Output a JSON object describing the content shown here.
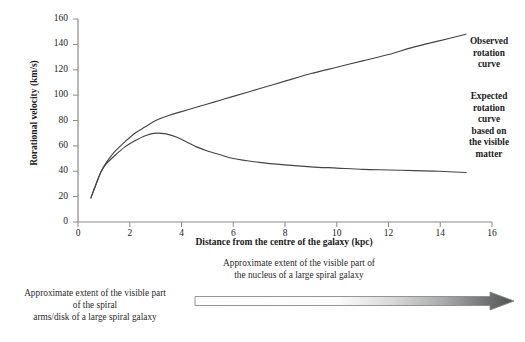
{
  "chart_data": {
    "type": "line",
    "title": "",
    "xlabel": "Distance from the centre of the galaxy (kpc)",
    "ylabel": "Rorational velocity (km/s)",
    "xlim": [
      0,
      16
    ],
    "ylim": [
      0,
      160
    ],
    "xticks": [
      "0",
      "2",
      "4",
      "6",
      "8",
      "10",
      "12",
      "14",
      "16"
    ],
    "yticks": [
      "0",
      "20",
      "40",
      "60",
      "80",
      "100",
      "120",
      "140",
      "160"
    ],
    "grid": false,
    "legend_position": "right-inline-annotations",
    "series": [
      {
        "name": "Observed rotation curve",
        "color": "#444444",
        "x": [
          0.5,
          0.7,
          0.9,
          1.1,
          1.4,
          1.8,
          2.2,
          2.6,
          3.0,
          3.5,
          4.0,
          4.5,
          5.0,
          5.5,
          6.0,
          7.0,
          8.0,
          9.0,
          10.0,
          11.0,
          12.0,
          13.0,
          14.0,
          15.0
        ],
        "y": [
          19,
          30,
          40,
          47,
          55,
          63,
          70,
          75,
          80,
          84,
          87,
          90,
          93,
          96,
          99,
          105,
          111,
          117,
          122,
          127,
          132,
          138,
          143,
          148
        ]
      },
      {
        "name": "Expected rotation curve based on the visible matter",
        "color": "#444444",
        "x": [
          0.5,
          0.7,
          0.9,
          1.1,
          1.4,
          1.8,
          2.2,
          2.6,
          3.0,
          3.4,
          3.8,
          4.2,
          4.6,
          5.0,
          5.5,
          6.0,
          7.0,
          8.0,
          9.0,
          10.0,
          11.0,
          12.0,
          13.0,
          14.0,
          15.0
        ],
        "y": [
          19,
          30,
          40,
          46,
          52,
          59,
          64,
          68,
          70,
          69.5,
          67,
          63,
          59,
          56,
          53,
          50,
          47,
          45,
          43.5,
          42.5,
          41.5,
          41,
          40.5,
          40,
          39
        ]
      }
    ],
    "annotations": [
      {
        "name": "observed-rotation-curve-label",
        "text": "Observed\nrotation\ncurve",
        "lines": [
          "Observed",
          "rotation",
          "curve"
        ]
      },
      {
        "name": "expected-rotation-curve-label",
        "text": "Expected rotation curve based on the visible matter",
        "lines": [
          "Expected",
          "rotation",
          "curve",
          "based on",
          "the visible",
          "matter"
        ]
      },
      {
        "name": "visible-disk-extent-caption",
        "lines": [
          "Approximate extent of the visible part",
          "of the spiral",
          "arms/disk of a large spiral galaxy"
        ]
      },
      {
        "name": "visible-nucleus-extent-caption",
        "lines": [
          "Approximate extent of the visible part of",
          "the nucleus of a large spiral galaxy"
        ]
      }
    ]
  },
  "axes": {
    "y_title": "Rorational velocity (km/s)",
    "x_title": "Distance from the centre of the galaxy (kpc)",
    "y_ticks": [
      "160",
      "140",
      "120",
      "100",
      "80",
      "60",
      "40",
      "20",
      "0"
    ],
    "x_ticks": [
      "0",
      "2",
      "4",
      "6",
      "8",
      "10",
      "12",
      "14",
      "16"
    ],
    "axis_color": "#808080"
  },
  "annotations": {
    "observed": {
      "line1": "Observed",
      "line2": "rotation",
      "line3": "curve"
    },
    "expected": {
      "line1": "Expected",
      "line2": "rotation",
      "line3": "curve",
      "line4": "based on",
      "line5": "the visible",
      "line6": "matter"
    }
  },
  "captions": {
    "disk": {
      "line1": "Approximate extent of the visible part",
      "line2": "of the spiral",
      "line3": "arms/disk of a large spiral galaxy"
    },
    "nucleus": {
      "line1": "Approximate extent of the visible part of",
      "line2": "the nucleus of a large spiral galaxy"
    }
  },
  "colors": {
    "curve": "#444444",
    "axis": "#8a8a8a",
    "arrow_start": "#ffffff",
    "arrow_end": "#4f5152",
    "arrow_outline": "#8a8a8a",
    "text": "#1b1b1b"
  }
}
